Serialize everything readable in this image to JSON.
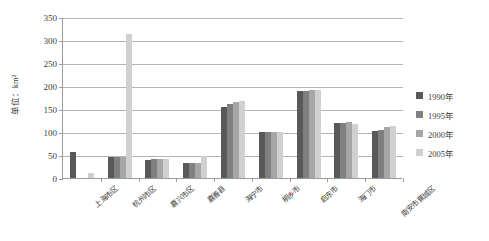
{
  "chart_data": {
    "type": "bar",
    "title": "",
    "xlabel": "",
    "ylabel": "单位：km²",
    "ylim": [
      0,
      350
    ],
    "yticks": [
      0,
      50,
      100,
      150,
      200,
      250,
      300,
      350
    ],
    "grid": true,
    "legend_position": "right",
    "categories": [
      "上海市区",
      "杭州市区",
      "嘉兴市区",
      "嘉善县",
      "海宁市",
      "桐乡市",
      "启东市",
      "海门市",
      "南安市蕉城区"
    ],
    "series": [
      {
        "name": "1990年",
        "color": "#595959",
        "values": [
          56,
          45,
          40,
          32,
          155,
          100,
          190,
          120,
          103
        ]
      },
      {
        "name": "1995年",
        "color": "#808080",
        "values": [
          null,
          45,
          41,
          32,
          160,
          100,
          190,
          120,
          105
        ]
      },
      {
        "name": "2000年",
        "color": "#a6a6a6",
        "values": [
          null,
          46,
          42,
          33,
          165,
          101,
          192,
          121,
          110
        ]
      },
      {
        "name": "2005年",
        "color": "#d0d0d0",
        "values": [
          10,
          312,
          42,
          48,
          168,
          101,
          192,
          118,
          112
        ]
      }
    ]
  },
  "axis": {
    "tick_labels": [
      "350",
      "300",
      "250",
      "200",
      "150",
      "100",
      "50",
      "0"
    ]
  },
  "legend": {
    "items": [
      {
        "label": "1990年",
        "color": "#595959"
      },
      {
        "label": "1995年",
        "color": "#808080"
      },
      {
        "label": "2000年",
        "color": "#a6a6a6"
      },
      {
        "label": "2005年",
        "color": "#d0d0d0"
      }
    ]
  }
}
